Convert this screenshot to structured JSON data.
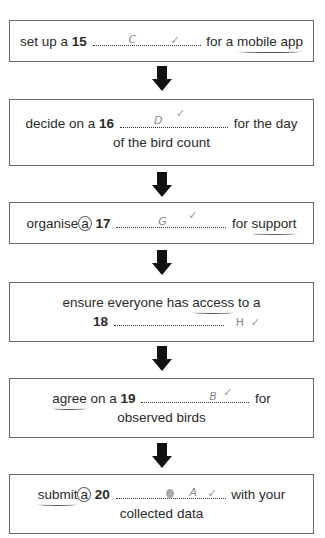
{
  "flowchart": {
    "steps": [
      {
        "number": "15",
        "before": "set up a",
        "after": "for a",
        "after_underlined": "mobile app",
        "line2": "",
        "answer": "C",
        "mark": "✓"
      },
      {
        "number": "16",
        "before": "decide on a",
        "after": "for the day",
        "line2": "of the bird count",
        "answer": "D",
        "mark": "✓"
      },
      {
        "number": "17",
        "before": "organise",
        "circled": "a",
        "after": "for",
        "after_underlined": "support",
        "line2": "",
        "answer": "G",
        "mark": "✓"
      },
      {
        "number": "18",
        "line1_before": "ensure everyone has",
        "line1_underlined": "access",
        "line1_after": "to a",
        "answer": "H",
        "mark": "✓"
      },
      {
        "number": "19",
        "before_underlined": "agree",
        "before": "on a",
        "after": "for",
        "line2": "observed birds",
        "answer": "B",
        "mark": "✓"
      },
      {
        "number": "20",
        "before_underlined": "submit",
        "circled": "a",
        "after": "with your",
        "line2": "collected data",
        "crossed_out": "scribble",
        "answer": "A",
        "mark": "✓"
      }
    ],
    "arrow_color": "#111111",
    "border_color": "#6a6a6a"
  }
}
